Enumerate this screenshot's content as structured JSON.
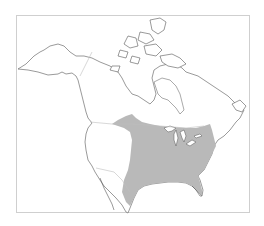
{
  "map": {
    "type": "range-map",
    "region": "North America",
    "colors": {
      "background": "#ffffff",
      "land": "#ffffff",
      "coastline": "#555555",
      "political_border": "#bdbdbd",
      "range_fill": "#b9b9b9",
      "frame": "#cfcfcf"
    },
    "shaded_range": {
      "description": "Eastern and central United States plus southern Canadian prairie strip",
      "fill": "#b9b9b9"
    }
  }
}
